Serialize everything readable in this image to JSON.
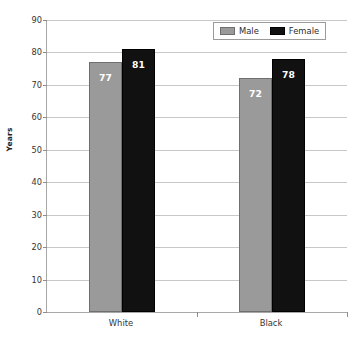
{
  "chart_data": {
    "type": "bar",
    "title": "",
    "subtitle": "",
    "xlabel": "",
    "ylabel": "Years",
    "categories": [
      "White",
      "Black"
    ],
    "series": [
      {
        "name": "Male",
        "color": "#9a9a9a",
        "values": [
          77,
          72
        ]
      },
      {
        "name": "Female",
        "color": "#111111",
        "values": [
          81,
          78
        ]
      }
    ],
    "ylim": [
      0,
      90
    ],
    "ytick_step": 10,
    "ytick_labels": [
      "0",
      "10",
      "20",
      "30",
      "40",
      "50",
      "60",
      "70",
      "80",
      "90"
    ],
    "data_labels": [
      "77",
      "81",
      "72",
      "78"
    ],
    "grid": true,
    "grid_axis": "y",
    "legend_position": "top-right",
    "grouping": "clustered",
    "annotations": []
  },
  "legend": {
    "items": [
      {
        "label": "Male",
        "swatch": "male"
      },
      {
        "label": "Female",
        "swatch": "female"
      }
    ]
  },
  "axes": {
    "y_title": "Years"
  }
}
